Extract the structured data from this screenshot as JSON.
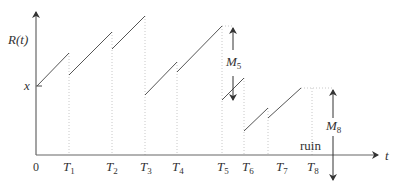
{
  "diagram": {
    "y_axis_label": "R(t)",
    "x_axis_label": "t",
    "origin_label": "0",
    "initial_level_label": "x",
    "time_labels": [
      {
        "name": "T",
        "sub": "1"
      },
      {
        "name": "T",
        "sub": "2"
      },
      {
        "name": "T",
        "sub": "3"
      },
      {
        "name": "T",
        "sub": "4"
      },
      {
        "name": "T",
        "sub": "5"
      },
      {
        "name": "T",
        "sub": "6"
      },
      {
        "name": "T",
        "sub": "7"
      },
      {
        "name": "T",
        "sub": "8"
      }
    ],
    "annotations": {
      "m5": {
        "name": "M",
        "sub": "5"
      },
      "m8": {
        "name": "M",
        "sub": "8"
      },
      "ruin": "ruin"
    },
    "colors": {
      "line": "#555555",
      "axis": "#666666",
      "dotted": "#c8c8c8",
      "text": "#333333"
    }
  }
}
